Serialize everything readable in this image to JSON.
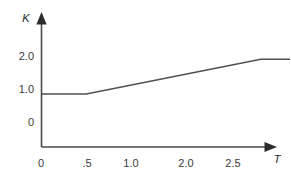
{
  "chart_data": {
    "type": "line",
    "title": "",
    "subtitle": "",
    "xlabel": "T",
    "ylabel": "K",
    "xlim": [
      0,
      2.95
    ],
    "ylim": [
      0,
      2.45
    ],
    "grid": false,
    "legend": "none",
    "x_ticks": [
      {
        "value": 0,
        "label": "0"
      },
      {
        "value": 0.5,
        "label": ".5"
      },
      {
        "value": 1.0,
        "label": "1.0"
      },
      {
        "value": 2.0,
        "label": "2.0"
      },
      {
        "value": 2.5,
        "label": "2.5"
      }
    ],
    "y_ticks": [
      {
        "value": 0,
        "label": "0"
      },
      {
        "value": 1.0,
        "label": "1.0"
      },
      {
        "value": 2.0,
        "label": "2.0"
      }
    ],
    "series": [
      {
        "name": "K(T)",
        "color": "#4f4f4f",
        "x": [
          0,
          0.5,
          2.45,
          2.95
        ],
        "y": [
          0.85,
          0.85,
          1.9,
          1.9
        ]
      }
    ],
    "annotations": []
  },
  "axes": {
    "y_axis_label": "K",
    "x_axis_label": "T",
    "y_arrow": "up-arrow-icon",
    "x_arrow": "right-arrow-icon"
  },
  "colors": {
    "background": "#ffffff",
    "axis": "#4a4a4a",
    "arrow": "#2c2c2c",
    "line": "#4f4f4f",
    "tick_text": "#3a3a3a",
    "label_text": "#1b1b1b"
  }
}
